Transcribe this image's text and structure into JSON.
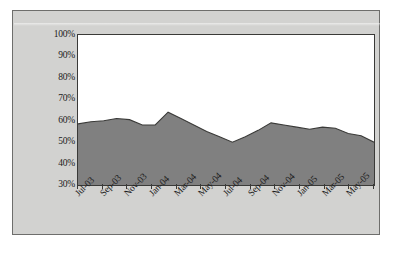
{
  "chart_data": {
    "type": "area",
    "title": "",
    "subtitle": "",
    "xlabel": "",
    "ylabel": "",
    "ylim": [
      30,
      100
    ],
    "ytick_labels": [
      "100%",
      "90%",
      "80%",
      "70%",
      "60%",
      "50%",
      "40%",
      "30%"
    ],
    "ytick_values": [
      100,
      90,
      80,
      70,
      60,
      50,
      40,
      30
    ],
    "xtick_labels": [
      "Jul-03",
      "Sep-03",
      "Nov-03",
      "Jan-04",
      "Mar-04",
      "May-04",
      "Jul-04",
      "Sep-04",
      "Nov-04",
      "Jan-05",
      "Mar-05",
      "May-05"
    ],
    "grid": false,
    "legend": "none",
    "fill_color": "#808080",
    "line_color": "#3a3a38",
    "plot_background": "#ffffff",
    "chart_background": "#d2d2d0",
    "categories": [
      "Jul-03",
      "Aug-03",
      "Sep-03",
      "Oct-03",
      "Nov-03",
      "Dec-03",
      "Jan-04",
      "Feb-04",
      "Mar-04",
      "Apr-04",
      "May-04",
      "Jun-04",
      "Jul-04",
      "Aug-04",
      "Sep-04",
      "Oct-04",
      "Nov-04",
      "Dec-04",
      "Jan-05",
      "Feb-05",
      "Mar-05",
      "Apr-05",
      "May-05",
      "Jun-05"
    ],
    "series": [
      {
        "name": "Percentage",
        "values": [
          58.5,
          59.5,
          60.0,
          61.0,
          60.5,
          58.0,
          58.0,
          64.0,
          61.0,
          58.0,
          55.0,
          52.5,
          50.0,
          52.5,
          55.5,
          59.0,
          58.0,
          57.0,
          56.0,
          57.0,
          56.5,
          54.0,
          53.0,
          50.0
        ]
      }
    ]
  }
}
